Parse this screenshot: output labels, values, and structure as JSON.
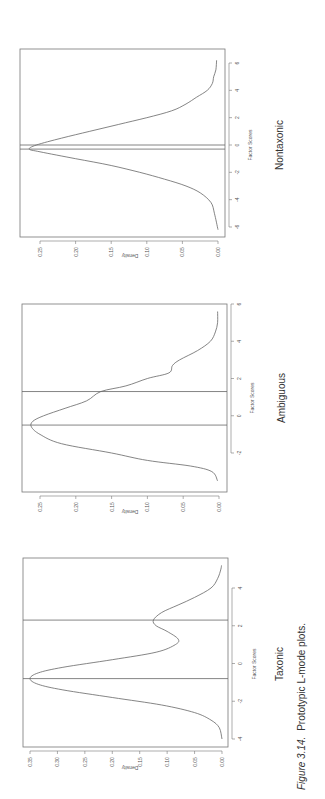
{
  "caption": {
    "figure_label": "Figure 3.14.",
    "text": "Prototypic L-mode plots."
  },
  "chart_data": [
    {
      "type": "line",
      "title": "Nontaxonic",
      "xlabel": "Factor Scores",
      "ylabel": "Density",
      "xlim": [
        -6.5,
        7
      ],
      "ylim": [
        0,
        0.27
      ],
      "xticks": [
        "-6",
        "-4",
        "-2",
        "0",
        "2",
        "4",
        "6"
      ],
      "yticks": [
        "0.00",
        "0.05",
        "0.10",
        "0.15",
        "0.20",
        "0.25"
      ],
      "grid": false,
      "vertical_lines": [
        -0.3,
        0.0
      ],
      "x": [
        -6.2,
        -5,
        -4.2,
        -3.5,
        -3,
        -2.5,
        -2,
        -1.5,
        -1,
        -0.5,
        -0.3,
        0,
        0.5,
        1,
        1.5,
        2,
        2.5,
        3,
        3.5,
        4,
        4.5,
        5,
        5.5,
        6.2
      ],
      "values": [
        0.0,
        0.005,
        0.01,
        0.025,
        0.045,
        0.075,
        0.11,
        0.15,
        0.2,
        0.25,
        0.265,
        0.255,
        0.22,
        0.18,
        0.14,
        0.1,
        0.065,
        0.045,
        0.03,
        0.015,
        0.008,
        0.006,
        0.003,
        0.002
      ]
    },
    {
      "type": "line",
      "title": "Ambiguous",
      "xlabel": "Factor Scores",
      "ylabel": "Density",
      "xlim": [
        -3.8,
        6
      ],
      "ylim": [
        0,
        0.27
      ],
      "xticks": [
        "-2",
        "0",
        "2",
        "4",
        "6"
      ],
      "yticks": [
        "0.00",
        "0.05",
        "0.10",
        "0.15",
        "0.20",
        "0.25"
      ],
      "grid": false,
      "vertical_lines": [
        -0.5,
        1.3
      ],
      "x": [
        -3.5,
        -3,
        -2.7,
        -2.4,
        -2,
        -1.5,
        -1,
        -0.6,
        -0.3,
        0,
        0.4,
        0.8,
        1.3,
        1.6,
        2,
        2.3,
        2.7,
        3,
        3.5,
        4,
        4.5,
        5,
        5.6
      ],
      "values": [
        0.002,
        0.01,
        0.04,
        0.1,
        0.15,
        0.22,
        0.25,
        0.262,
        0.26,
        0.245,
        0.215,
        0.185,
        0.165,
        0.13,
        0.1,
        0.07,
        0.065,
        0.055,
        0.03,
        0.012,
        0.005,
        0.002,
        0.002
      ]
    },
    {
      "type": "line",
      "title": "Taxonic",
      "xlabel": "Factor Scores",
      "ylabel": "Density",
      "xlim": [
        -4.2,
        5.6
      ],
      "ylim": [
        0,
        0.36
      ],
      "xticks": [
        "-4",
        "-2",
        "0",
        "2",
        "4"
      ],
      "yticks": [
        "0.00",
        "0.05",
        "0.10",
        "0.15",
        "0.20",
        "0.25",
        "0.30",
        "0.35"
      ],
      "grid": false,
      "vertical_lines": [
        -0.8,
        2.3
      ],
      "x": [
        -4,
        -3.4,
        -3,
        -2.6,
        -2.2,
        -1.8,
        -1.4,
        -1.1,
        -0.8,
        -0.5,
        -0.2,
        0.2,
        0.6,
        1.0,
        1.3,
        1.7,
        2.0,
        2.3,
        2.7,
        3.1,
        3.5,
        4.0,
        4.5,
        5.0,
        5.2
      ],
      "values": [
        0.0,
        0.005,
        0.02,
        0.05,
        0.11,
        0.2,
        0.29,
        0.335,
        0.35,
        0.335,
        0.29,
        0.2,
        0.12,
        0.085,
        0.08,
        0.1,
        0.12,
        0.125,
        0.11,
        0.08,
        0.05,
        0.02,
        0.008,
        0.002,
        0.001
      ]
    }
  ],
  "panels": [
    {
      "title": "Nontaxonic",
      "xlabel": "Factor Scores",
      "ylabel": "Density",
      "xticks": [
        "-6",
        "-4",
        "-2",
        "0",
        "2",
        "4",
        "6"
      ],
      "yticks": [
        "0.00",
        "0.05",
        "0.10",
        "0.15",
        "0.20",
        "0.25"
      ]
    },
    {
      "title": "Ambiguous",
      "xlabel": "Factor Scores",
      "ylabel": "Density",
      "xticks": [
        "-2",
        "0",
        "2",
        "4",
        "6"
      ],
      "yticks": [
        "0.00",
        "0.05",
        "0.10",
        "0.15",
        "0.20",
        "0.25"
      ]
    },
    {
      "title": "Taxonic",
      "xlabel": "Factor Scores",
      "ylabel": "Density",
      "xticks": [
        "-4",
        "-2",
        "0",
        "2",
        "4"
      ],
      "yticks": [
        "0.00",
        "0.05",
        "0.10",
        "0.15",
        "0.20",
        "0.25",
        "0.30",
        "0.35"
      ]
    }
  ]
}
